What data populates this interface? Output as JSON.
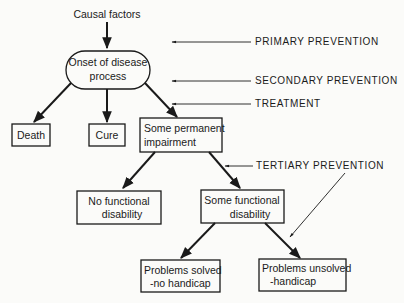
{
  "diagram": {
    "top_label": "Causal factors",
    "nodes": {
      "onset": [
        "Onset of disease",
        "process"
      ],
      "death": "Death",
      "cure": "Cure",
      "impairment": [
        "Some permanent",
        "impairment"
      ],
      "no_disability": [
        "No functional",
        "disability"
      ],
      "some_disability": [
        "Some functional",
        "disability"
      ],
      "solved": [
        "Problems solved",
        "-no handicap"
      ],
      "unsolved": [
        "Problems unsolved",
        "-handicap"
      ]
    },
    "annotations": {
      "primary": "PRIMARY PREVENTION",
      "secondary": "SECONDARY PREVENTION",
      "treatment": "TREATMENT",
      "tertiary": "TERTIARY PREVENTION"
    }
  }
}
